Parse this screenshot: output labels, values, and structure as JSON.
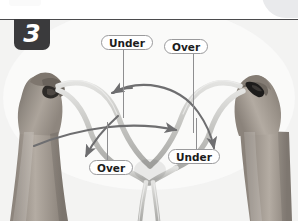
{
  "page": {
    "background_color": "#ffffff",
    "rule_color": "#4b4b4d",
    "corner_tab_color": "#e9eaec"
  },
  "step": {
    "number": "3",
    "badge_background": "#3a3a3c",
    "badge_text_color": "#ffffff"
  },
  "photo": {
    "description": "Two hands tying a knot with light gray cord, grayscale photograph",
    "background_color": "#f4f4f3",
    "cord_color": "#c9c9c7",
    "skin_color": "#9b948e",
    "arrow_color": "#6e6e70"
  },
  "callouts": [
    {
      "id": "under-top",
      "label": "Under",
      "position": "top-left"
    },
    {
      "id": "over-top",
      "label": "Over",
      "position": "top-right"
    },
    {
      "id": "over-bot",
      "label": "Over",
      "position": "bottom-left"
    },
    {
      "id": "under-bot",
      "label": "Under",
      "position": "bottom-right"
    }
  ],
  "arrows": [
    {
      "id": "arrow-left",
      "direction": "points-left",
      "color": "#6e6e70"
    },
    {
      "id": "arrow-mid",
      "direction": "points-right",
      "color": "#6e6e70"
    },
    {
      "id": "arrow-down",
      "direction": "points-down-right",
      "color": "#6e6e70"
    },
    {
      "id": "arrow-sw",
      "direction": "points-down-left",
      "color": "#6e6e70"
    }
  ]
}
